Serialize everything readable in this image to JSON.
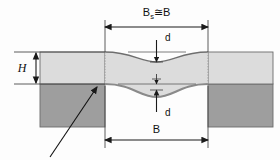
{
  "diagram": {
    "background_color": "#fdfdfd",
    "labels": {
      "top_width_base": "B",
      "top_width_subscript": "s",
      "top_width_relation": "≅",
      "top_width_compare": "B",
      "height": "H",
      "deflection_upper": "d",
      "deflection_lower": "d",
      "bottom_width": "B"
    },
    "colors": {
      "upper_band_fill": "#dcdcdc",
      "lower_block_fill": "#9e9e9e",
      "outline": "#555555",
      "curve_stroke": "#6e6e6e",
      "dimension_line": "#1a1a1a",
      "dotted_extension": "#8a8a8a",
      "leader_arrow": "#111111"
    },
    "geometry": {
      "left_block_x": 40,
      "center_left_x": 105,
      "center_right_x": 208,
      "right_block_x_end": 273,
      "upper_band_top_y": 52,
      "interface_y": 84,
      "block_bottom_y": 127,
      "upper_sag_depth": 10,
      "lower_sag_depth": 13
    }
  }
}
